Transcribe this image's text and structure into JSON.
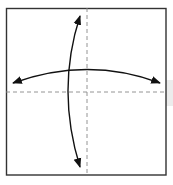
{
  "diagram": {
    "paper": {
      "x": 6,
      "y": 8,
      "width": 160,
      "height": 167,
      "stroke": "#333333"
    },
    "crease_lines": [
      {
        "name": "vertical-valley-crease",
        "style": "dashed",
        "color": "#888888"
      },
      {
        "name": "horizontal-valley-crease",
        "style": "dashed",
        "color": "#888888"
      }
    ],
    "arrows": [
      {
        "name": "vertical-fold-unfold-arrow",
        "type": "double-headed curved",
        "color": "#111111"
      },
      {
        "name": "horizontal-fold-unfold-arrow",
        "type": "double-headed curved",
        "color": "#111111"
      }
    ]
  }
}
